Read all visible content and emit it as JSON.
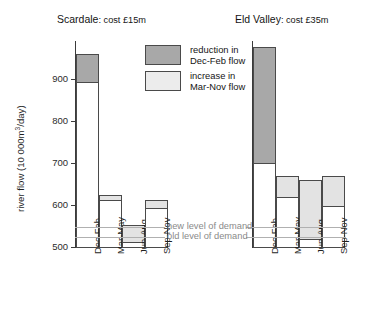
{
  "chart_data": {
    "type": "bar",
    "title": "",
    "xlabel": "",
    "ylabel": "river flow (10 000m3/day)",
    "ylabel_parts": {
      "pre": "river flow (10 000m",
      "sup": "3",
      "post": "/day)"
    },
    "ylim": [
      500,
      990
    ],
    "yticks": [
      500,
      600,
      700,
      800,
      900
    ],
    "ytick_labels": [
      "500",
      "600",
      "700",
      "800",
      "900"
    ],
    "grid": false,
    "legend_position": "top-center",
    "categories": [
      "Dec-Feb",
      "Mar-May",
      "Jun-Aug",
      "Sep-Nov"
    ],
    "legend": [
      {
        "key": "reduction",
        "label_line1": "reduction in",
        "label_line2": "Dec-Feb flow",
        "color": "#a8a8a8"
      },
      {
        "key": "increase",
        "label_line1": "increase in",
        "label_line2": "Mar-Nov flow",
        "color": "#ececec"
      }
    ],
    "annotations": [
      {
        "name": "new-level-of-demand",
        "label": "new level of demand",
        "value": 548
      },
      {
        "name": "old-level-of-demand",
        "label": "old level of demand",
        "value": 524
      }
    ],
    "panels": [
      {
        "key": "scardale",
        "name": "Scardale",
        "cost": "cost £15m",
        "title_name": "Scardale",
        "title_cost": ": cost £15m",
        "bars": [
          {
            "category": "Dec-Feb",
            "total": 960,
            "base": 500,
            "change_kind": "reduction",
            "change_from": 893,
            "change_to": 960
          },
          {
            "category": "Mar-May",
            "total": 623,
            "base": 500,
            "change_kind": "increase",
            "change_from": 611,
            "change_to": 623
          },
          {
            "category": "Jun-Aug",
            "total": 552,
            "base": 500,
            "change_kind": "increase",
            "change_from": 513,
            "change_to": 552
          },
          {
            "category": "Sep-Nov",
            "total": 613,
            "base": 500,
            "change_kind": "increase",
            "change_from": 592,
            "change_to": 613
          }
        ]
      },
      {
        "key": "eld-valley",
        "name": "Eld Valley",
        "cost": "cost £35m",
        "title_name": "Eld Valley",
        "title_cost": ": cost £35m",
        "bars": [
          {
            "category": "Dec-Feb",
            "total": 976,
            "base": 500,
            "change_kind": "reduction",
            "change_from": 700,
            "change_to": 976
          },
          {
            "category": "Mar-May",
            "total": 670,
            "base": 500,
            "change_kind": "increase",
            "change_from": 620,
            "change_to": 670
          },
          {
            "category": "Jun-Aug",
            "total": 660,
            "base": 500,
            "change_kind": "increase",
            "change_from": 520,
            "change_to": 660
          },
          {
            "category": "Sep-Nov",
            "total": 670,
            "base": 500,
            "change_kind": "increase",
            "change_from": 598,
            "change_to": 670
          }
        ]
      }
    ]
  }
}
